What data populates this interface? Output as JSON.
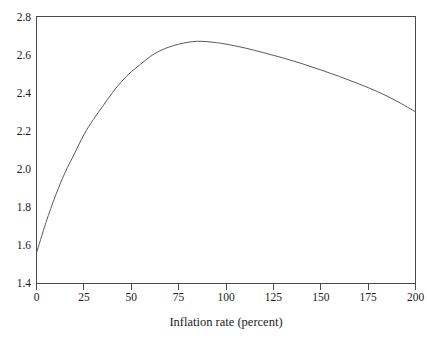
{
  "chart_data": {
    "type": "line",
    "title": "",
    "subtitle": "",
    "xlabel": "Inflation rate (percent)",
    "ylabel": "",
    "xlim": [
      0,
      200
    ],
    "ylim": [
      1.4,
      2.8
    ],
    "grid": false,
    "legend": null,
    "legend_position": "none",
    "x_ticks": [
      0,
      25,
      50,
      75,
      100,
      125,
      150,
      175,
      200
    ],
    "x_tick_labels": [
      "0",
      "25",
      "50",
      "75",
      "100",
      "125",
      "150",
      "175",
      "200"
    ],
    "y_ticks": [
      1.4,
      1.6,
      1.8,
      2.0,
      2.2,
      2.4,
      2.6,
      2.8
    ],
    "y_tick_labels": [
      "1.4",
      "1.6",
      "1.8",
      "2.0",
      "2.2",
      "2.4",
      "2.6",
      "2.8"
    ],
    "series": [
      {
        "name": "welfare",
        "color": "#5a5a5a",
        "x": [
          0,
          5,
          10,
          15,
          20,
          25,
          30,
          35,
          40,
          45,
          50,
          55,
          60,
          65,
          70,
          75,
          80,
          85,
          90,
          95,
          100,
          110,
          120,
          130,
          140,
          150,
          160,
          170,
          180,
          190,
          200
        ],
        "y": [
          1.56,
          1.72,
          1.86,
          1.98,
          2.08,
          2.18,
          2.26,
          2.33,
          2.4,
          2.46,
          2.51,
          2.55,
          2.59,
          2.62,
          2.64,
          2.655,
          2.665,
          2.67,
          2.668,
          2.663,
          2.655,
          2.635,
          2.61,
          2.583,
          2.553,
          2.52,
          2.485,
          2.447,
          2.406,
          2.357,
          2.3
        ]
      }
    ],
    "annotations": []
  },
  "axis": {
    "x_title": "Inflation rate (percent)"
  }
}
